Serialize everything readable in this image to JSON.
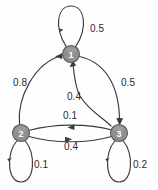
{
  "diagram": {
    "type": "state-transition-diagram",
    "title": "",
    "nodes": [
      {
        "id": "1",
        "label": "1",
        "cx": 71,
        "cy": 54,
        "r": 8.5
      },
      {
        "id": "2",
        "label": "2",
        "cx": 21,
        "cy": 133,
        "r": 8.5
      },
      {
        "id": "3",
        "label": "3",
        "cx": 119,
        "cy": 133,
        "r": 8.5
      }
    ],
    "edges": [
      {
        "id": "e11",
        "from": "1",
        "to": "1",
        "weight": "0.5",
        "kind": "self-loop",
        "lx": 97,
        "ly": 28
      },
      {
        "id": "e21",
        "from": "2",
        "to": "1",
        "weight": "0.8",
        "kind": "curve",
        "lx": 20,
        "ly": 82
      },
      {
        "id": "e13",
        "from": "1",
        "to": "3",
        "weight": "0.5",
        "kind": "curve",
        "lx": 128,
        "ly": 82
      },
      {
        "id": "e31",
        "from": "3",
        "to": "1",
        "weight": "0.4",
        "kind": "curve",
        "lx": 74,
        "ly": 96
      },
      {
        "id": "e23",
        "from": "2",
        "to": "3",
        "weight": "0.1",
        "kind": "line",
        "lx": 70,
        "ly": 115
      },
      {
        "id": "e32",
        "from": "3",
        "to": "2",
        "weight": "0.4",
        "kind": "line",
        "lx": 71,
        "ly": 146
      },
      {
        "id": "e22",
        "from": "2",
        "to": "2",
        "weight": "0.1",
        "kind": "self-loop",
        "lx": 41,
        "ly": 164
      },
      {
        "id": "e33",
        "from": "3",
        "to": "3",
        "weight": "0.2",
        "kind": "self-loop",
        "lx": 140,
        "ly": 164
      }
    ],
    "colors": {
      "node_fill": "#8f8f8f",
      "node_stroke": "#5b5b5b",
      "node_text": "#ffffff",
      "edge_stroke": "#3a3a3a",
      "weight_text": "#2b2b2b",
      "background": "#fefefe"
    }
  }
}
